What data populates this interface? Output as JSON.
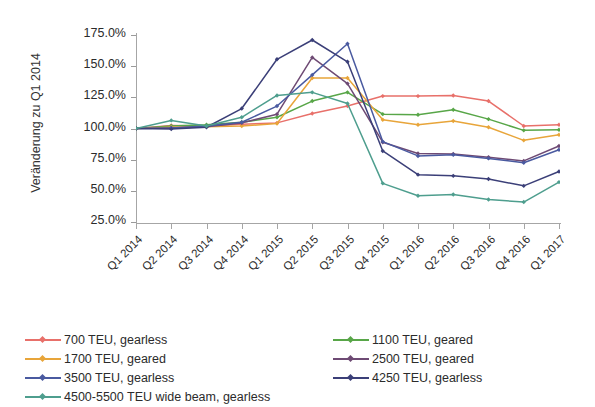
{
  "chart_data": {
    "type": "line",
    "title": "",
    "xlabel": "",
    "ylabel": "Veränderung zu Q1 2014",
    "ylim": [
      25,
      175
    ],
    "ytick_step": 25,
    "ytick_labels": [
      "175.0%",
      "150.0%",
      "125.0%",
      "100.0%",
      "75.0%",
      "50.0%",
      "25.0%"
    ],
    "ytick_values": [
      175,
      150,
      125,
      100,
      75,
      50,
      25
    ],
    "grid": false,
    "legend_position": "bottom",
    "categories": [
      "Q1 2014",
      "Q2 2014",
      "Q3 2014",
      "Q4 2014",
      "Q1 2015",
      "Q2 2015",
      "Q3 2015",
      "Q4 2015",
      "Q1 2016",
      "Q2 2016",
      "Q3 2016",
      "Q4 2016",
      "Q1 2017"
    ],
    "series": [
      {
        "name": "700 TEU, gearless",
        "color": "#e8706a",
        "values": [
          100.0,
          102.5,
          102.0,
          103.5,
          104.5,
          112.0,
          118.0,
          126.0,
          126.0,
          126.5,
          122.0,
          102.0,
          103.0
        ]
      },
      {
        "name": "1100 TEU, geared",
        "color": "#58a648",
        "values": [
          100.0,
          102.0,
          103.0,
          105.0,
          109.0,
          122.0,
          129.0,
          111.5,
          111.0,
          115.0,
          107.5,
          98.5,
          99.0
        ]
      },
      {
        "name": "1700 TEU, geared",
        "color": "#e8a53a",
        "values": [
          100.0,
          101.0,
          101.5,
          102.0,
          104.0,
          140.5,
          140.5,
          107.0,
          103.0,
          106.0,
          101.0,
          90.5,
          95.0
        ]
      },
      {
        "name": "2500 TEU, geared",
        "color": "#6e4a74",
        "values": [
          100.0,
          100.5,
          101.5,
          104.5,
          111.5,
          157.0,
          136.0,
          89.0,
          80.0,
          79.5,
          77.0,
          74.0,
          86.0
        ]
      },
      {
        "name": "3500 TEU, gearless",
        "color": "#4a5aa0",
        "values": [
          100.0,
          100.5,
          102.0,
          105.0,
          118.0,
          143.0,
          168.0,
          89.5,
          78.0,
          79.0,
          76.0,
          72.5,
          83.0
        ]
      },
      {
        "name": "4250 TEU, gearless",
        "color": "#3b3f78",
        "values": [
          100.0,
          99.5,
          101.0,
          116.0,
          155.5,
          171.0,
          153.5,
          82.0,
          63.0,
          62.0,
          59.5,
          54.0,
          65.5
        ]
      },
      {
        "name": "4500-5500 TEU wide beam, gearless",
        "color": "#4e9e8e",
        "values": [
          100.0,
          106.5,
          102.0,
          109.0,
          126.5,
          129.0,
          120.0,
          56.0,
          46.0,
          47.0,
          43.0,
          41.0,
          57.0
        ]
      }
    ]
  },
  "legend": {
    "column1": [
      {
        "label": "700 TEU, gearless",
        "color": "#e8706a"
      },
      {
        "label": "1700 TEU, geared",
        "color": "#e8a53a"
      },
      {
        "label": "3500 TEU, gearless",
        "color": "#4a5aa0"
      },
      {
        "label": "4500-5500 TEU wide beam, gearless",
        "color": "#4e9e8e"
      }
    ],
    "column2": [
      {
        "label": "1100 TEU, geared",
        "color": "#58a648"
      },
      {
        "label": "2500 TEU, geared",
        "color": "#6e4a74"
      },
      {
        "label": "4250 TEU, gearless",
        "color": "#3b3f78"
      }
    ]
  }
}
